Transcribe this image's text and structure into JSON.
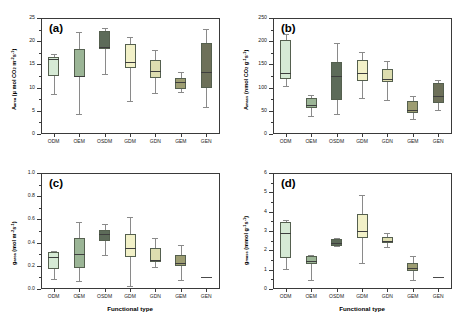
{
  "figure": {
    "xlabel": "Functional type",
    "categories": [
      "ODM",
      "OEM",
      "OSDM",
      "GDM",
      "GDN",
      "GEM",
      "GEN"
    ],
    "colors": [
      "#d6ead5",
      "#9bb596",
      "#5d6b59",
      "#f2f1c8",
      "#ddddb0",
      "#9d9d72",
      "#6d7059"
    ]
  },
  "panels": {
    "a": {
      "label": "(a)",
      "ylabel_text": "Aarea (µ mol CO2 m-2 s-1)",
      "ticks": [
        "0",
        "5",
        "10",
        "15",
        "20",
        "25"
      ]
    },
    "b": {
      "label": "(b)",
      "ylabel_text": "Amass (nmol CO2 g-1 s-1)",
      "ticks": [
        "0",
        "50",
        "100",
        "150",
        "200",
        "250"
      ]
    },
    "c": {
      "label": "(c)",
      "ylabel_text": "garea (mol m-2 s-1)",
      "ticks": [
        "0.0",
        "0.2",
        "0.4",
        "0.6",
        "0.8",
        "1.0"
      ]
    },
    "d": {
      "label": "(d)",
      "ylabel_text": "gmass (mmol g-1 s-1)",
      "ticks": [
        "0",
        "1",
        "2",
        "3",
        "4",
        "5",
        "6"
      ]
    }
  },
  "chart_data": [
    {
      "type": "box",
      "panel": "a",
      "title": "(a)",
      "xlabel": "Functional type",
      "ylabel": "A_area (µmol CO2 m^-2 s^-1)",
      "ylim": [
        0,
        25
      ],
      "yticks": [
        0,
        5,
        10,
        15,
        20,
        25
      ],
      "categories": [
        "ODM",
        "OEM",
        "OSDM",
        "GDM",
        "GDN",
        "GEM",
        "GEN"
      ],
      "boxes": [
        {
          "category": "ODM",
          "whisker_low": 8.7,
          "q1": 12.4,
          "median": 16.2,
          "q3": 16.6,
          "whisker_high": 17.3
        },
        {
          "category": "OEM",
          "whisker_low": 4.3,
          "q1": 12.2,
          "median": 12.6,
          "q3": 18.4,
          "whisker_high": 21.9
        },
        {
          "category": "OSDM",
          "whisker_low": 13.0,
          "q1": 18.3,
          "median": 18.8,
          "q3": 22.1,
          "whisker_high": 22.9
        },
        {
          "category": "GDM",
          "whisker_low": 7.1,
          "q1": 14.2,
          "median": 15.6,
          "q3": 19.4,
          "whisker_high": 20.9
        },
        {
          "category": "GDN",
          "whisker_low": 8.8,
          "q1": 12.1,
          "median": 13.5,
          "q3": 16.0,
          "whisker_high": 18.1
        },
        {
          "category": "GEM",
          "whisker_low": 9.1,
          "q1": 9.8,
          "median": 11.2,
          "q3": 12.1,
          "whisker_high": 13.4
        },
        {
          "category": "GEN",
          "whisker_low": 5.9,
          "q1": 9.9,
          "median": 13.4,
          "q3": 19.6,
          "whisker_high": 22.6
        }
      ]
    },
    {
      "type": "box",
      "panel": "b",
      "title": "(b)",
      "xlabel": "Functional type",
      "ylabel": "A_mass (nmol CO2 g^-1 s^-1)",
      "ylim": [
        0,
        250
      ],
      "yticks": [
        0,
        50,
        100,
        150,
        200,
        250
      ],
      "categories": [
        "ODM",
        "OEM",
        "OSDM",
        "GDM",
        "GDN",
        "GEM",
        "GEN"
      ],
      "boxes": [
        {
          "category": "ODM",
          "whisker_low": 104,
          "q1": 119,
          "median": 131,
          "q3": 203,
          "whisker_high": 215
        },
        {
          "category": "OEM",
          "whisker_low": 39,
          "q1": 56,
          "median": 62,
          "q3": 78,
          "whisker_high": 84
        },
        {
          "category": "OSDM",
          "whisker_low": 44,
          "q1": 74,
          "median": 125,
          "q3": 156,
          "whisker_high": 196
        },
        {
          "category": "GDM",
          "whisker_low": 77,
          "q1": 115,
          "median": 131,
          "q3": 160,
          "whisker_high": 176
        },
        {
          "category": "GDN",
          "whisker_low": 73,
          "q1": 111,
          "median": 119,
          "q3": 140,
          "whisker_high": 157
        },
        {
          "category": "GEM",
          "whisker_low": 33,
          "q1": 45,
          "median": 51,
          "q3": 71,
          "whisker_high": 81
        },
        {
          "category": "GEN",
          "whisker_low": 51,
          "q1": 66,
          "median": 82,
          "q3": 110,
          "whisker_high": 117
        }
      ]
    },
    {
      "type": "box",
      "panel": "c",
      "title": "(c)",
      "xlabel": "Functional type",
      "ylabel": "g_area (mol m^-2 s^-1)",
      "ylim": [
        0.0,
        1.0
      ],
      "yticks": [
        0.0,
        0.2,
        0.4,
        0.6,
        0.8,
        1.0
      ],
      "categories": [
        "ODM",
        "OEM",
        "OSDM",
        "GDM",
        "GDN",
        "GEM",
        "GEN"
      ],
      "boxes": [
        {
          "category": "ODM",
          "whisker_low": 0.09,
          "q1": 0.17,
          "median": 0.28,
          "q3": 0.32,
          "whisker_high": 0.33
        },
        {
          "category": "OEM",
          "whisker_low": 0.07,
          "q1": 0.18,
          "median": 0.3,
          "q3": 0.44,
          "whisker_high": 0.58
        },
        {
          "category": "OSDM",
          "whisker_low": 0.29,
          "q1": 0.41,
          "median": 0.47,
          "q3": 0.51,
          "whisker_high": 0.56
        },
        {
          "category": "GDM",
          "whisker_low": 0.03,
          "q1": 0.28,
          "median": 0.35,
          "q3": 0.47,
          "whisker_high": 0.62
        },
        {
          "category": "GDN",
          "whisker_low": 0.19,
          "q1": 0.23,
          "median": 0.25,
          "q3": 0.35,
          "whisker_high": 0.44
        },
        {
          "category": "GEM",
          "whisker_low": 0.08,
          "q1": 0.2,
          "median": 0.22,
          "q3": 0.29,
          "whisker_high": 0.38
        },
        {
          "category": "GEN",
          "whisker_low": 0.1,
          "q1": 0.1,
          "median": 0.1,
          "q3": 0.1,
          "whisker_high": 0.1
        }
      ]
    },
    {
      "type": "box",
      "panel": "d",
      "title": "(d)",
      "xlabel": "Functional type",
      "ylabel": "g_mass (mmol g^-1 s^-1)",
      "ylim": [
        0,
        6
      ],
      "yticks": [
        0,
        1,
        2,
        3,
        4,
        5,
        6
      ],
      "categories": [
        "ODM",
        "OEM",
        "OSDM",
        "GDM",
        "GDN",
        "GEM",
        "GEN"
      ],
      "boxes": [
        {
          "category": "ODM",
          "whisker_low": 1.05,
          "q1": 1.62,
          "median": 2.88,
          "q3": 3.45,
          "whisker_high": 3.55
        },
        {
          "category": "OEM",
          "whisker_low": 0.48,
          "q1": 1.28,
          "median": 1.45,
          "q3": 1.7,
          "whisker_high": 1.75
        },
        {
          "category": "OSDM",
          "whisker_low": 2.2,
          "q1": 2.22,
          "median": 2.4,
          "q3": 2.6,
          "whisker_high": 2.62
        },
        {
          "category": "GDM",
          "whisker_low": 1.35,
          "q1": 2.62,
          "median": 2.98,
          "q3": 3.88,
          "whisker_high": 4.88
        },
        {
          "category": "GDN",
          "whisker_low": 2.18,
          "q1": 2.4,
          "median": 2.5,
          "q3": 2.68,
          "whisker_high": 2.92
        },
        {
          "category": "GEM",
          "whisker_low": 0.47,
          "q1": 0.92,
          "median": 1.1,
          "q3": 1.35,
          "whisker_high": 1.72
        },
        {
          "category": "GEN",
          "whisker_low": 0.62,
          "q1": 0.62,
          "median": 0.62,
          "q3": 0.62,
          "whisker_high": 0.62
        }
      ]
    }
  ]
}
